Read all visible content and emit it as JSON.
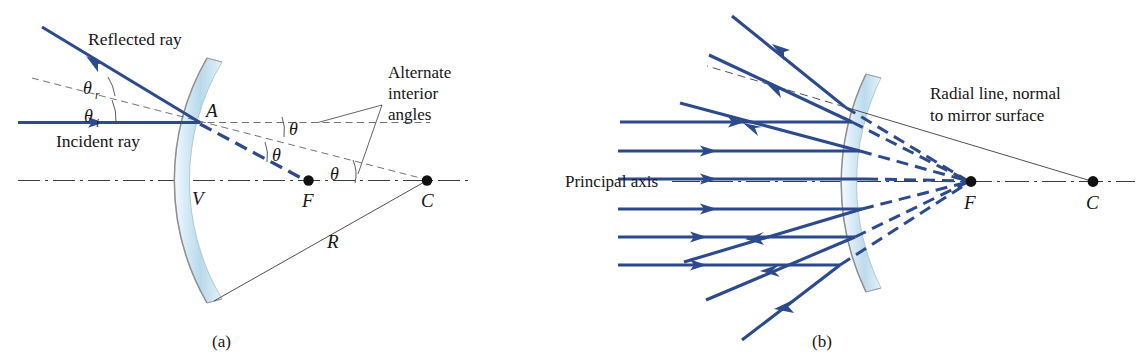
{
  "figure": {
    "colors": {
      "ray_blue": "#2c4a8c",
      "mirror_fill_light": "#eaf3fa",
      "mirror_fill_mid": "#c3dcec",
      "mirror_edge": "#8a8a8a",
      "construction_line": "#4a4a4a",
      "text": "#161616",
      "point_dot": "#111111"
    },
    "panels": [
      {
        "id": "a",
        "caption": "(a)",
        "labels": {
          "reflected_ray": "Reflected ray",
          "incident_ray": "Incident ray",
          "theta_reflected": "θ",
          "theta_reflected_sub": "r",
          "theta_incident": "θ",
          "theta_incident_sub": "i",
          "alternate_interior_line1": "Alternate",
          "alternate_interior_line2": "interior",
          "alternate_interior_line3": "angles",
          "point_A": "A",
          "point_V": "V",
          "point_F": "F",
          "point_C": "C",
          "radius_R": "R",
          "theta_1": "θ",
          "theta_2": "θ",
          "theta_3": "θ"
        }
      },
      {
        "id": "b",
        "caption": "(b)",
        "labels": {
          "radial_line_1": "Radial line, normal",
          "radial_line_2": "to mirror surface",
          "principal_axis": "Principal axis",
          "point_F": "F",
          "point_C": "C"
        }
      }
    ]
  }
}
